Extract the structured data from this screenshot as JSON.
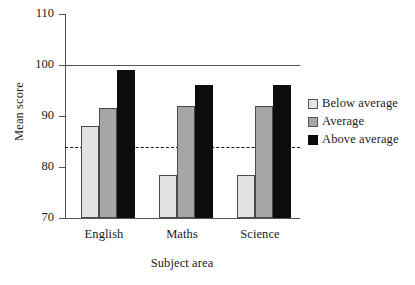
{
  "chart_data": {
    "type": "bar",
    "title": "",
    "xlabel": "Subject area",
    "ylabel": "Mean score",
    "categories": [
      "English",
      "Maths",
      "Science"
    ],
    "series": [
      {
        "name": "Below average",
        "color": "#e2e2e2",
        "values": [
          88,
          78.5,
          78.5
        ]
      },
      {
        "name": "Average",
        "color": "#a6a6a6",
        "values": [
          91.5,
          92,
          92
        ]
      },
      {
        "name": "Above average",
        "color": "#0d0d0d",
        "values": [
          99,
          96,
          96
        ]
      }
    ],
    "ylim": [
      70,
      110
    ],
    "yticks": [
      70,
      80,
      90,
      100,
      110
    ],
    "ytick_labels": [
      "70",
      "80",
      "90",
      "100",
      "110"
    ],
    "grid": false,
    "legend_position": "right",
    "reference_lines": [
      {
        "name": "solid-reference-line",
        "value": 100,
        "style": "solid"
      },
      {
        "name": "dashed-reference-line",
        "value": 84,
        "style": "dashed"
      }
    ]
  }
}
